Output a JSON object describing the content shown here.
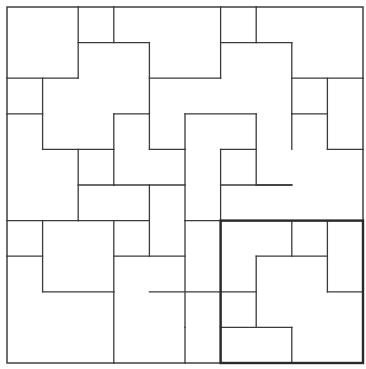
{
  "figure": {
    "type": "tiling-diagram",
    "grid": {
      "columns": 10,
      "rows": 10,
      "origin_px": [
        7,
        7
      ],
      "unit_px": 35.6
    },
    "colors": {
      "line": "#3a3a3a",
      "background": "#ffffff",
      "highlight": "#2a2a2a"
    },
    "outer_square": {
      "x0": 0,
      "y0": 0,
      "x1": 10,
      "y1": 10
    },
    "highlight_block": {
      "x0": 6,
      "y0": 6,
      "x1": 10,
      "y1": 10,
      "label": "fundamental-block"
    },
    "segments": [
      [
        2,
        0,
        2,
        2
      ],
      [
        3,
        0,
        3,
        1
      ],
      [
        2,
        1,
        4,
        1
      ],
      [
        4,
        1,
        4,
        3
      ],
      [
        0,
        2,
        2,
        2
      ],
      [
        1,
        2,
        1,
        4
      ],
      [
        0,
        3,
        1,
        3
      ],
      [
        4,
        2,
        6,
        2
      ],
      [
        6,
        0,
        6,
        2
      ],
      [
        7,
        0,
        7,
        1
      ],
      [
        6,
        1,
        8,
        1
      ],
      [
        8,
        1,
        8,
        3
      ],
      [
        8,
        2,
        10,
        2
      ],
      [
        9,
        2,
        9,
        4
      ],
      [
        8,
        3,
        9,
        3
      ],
      [
        9,
        4,
        10,
        4
      ],
      [
        3,
        3,
        4,
        3
      ],
      [
        3,
        3,
        3,
        5
      ],
      [
        1,
        4,
        3,
        4
      ],
      [
        2,
        4,
        2,
        6
      ],
      [
        4,
        3,
        4,
        4
      ],
      [
        4,
        4,
        5,
        4
      ],
      [
        5,
        3,
        5,
        4
      ],
      [
        5,
        3,
        7,
        3
      ],
      [
        7,
        3,
        7,
        5
      ],
      [
        6,
        4,
        7,
        4
      ],
      [
        6,
        4,
        6,
        6
      ],
      [
        8,
        3,
        8,
        4
      ],
      [
        7,
        5,
        8,
        5
      ],
      [
        5,
        4,
        5,
        6
      ],
      [
        3,
        5,
        5,
        5
      ],
      [
        2,
        6,
        4,
        6
      ],
      [
        0,
        6,
        2,
        6
      ],
      [
        1,
        6,
        1,
        8
      ],
      [
        0,
        7,
        1,
        7
      ],
      [
        1,
        8,
        3,
        8
      ],
      [
        3,
        8,
        3,
        10
      ],
      [
        2,
        5,
        3,
        5
      ],
      [
        4,
        5,
        4,
        7
      ],
      [
        3,
        7,
        5,
        7
      ],
      [
        3,
        6,
        3,
        8
      ],
      [
        4,
        8,
        6,
        8
      ],
      [
        5,
        6,
        6,
        6
      ],
      [
        5,
        6,
        5,
        9
      ],
      [
        6,
        5,
        8,
        5
      ],
      [
        6,
        6,
        10,
        6
      ],
      [
        8,
        6,
        8,
        7
      ],
      [
        7,
        7,
        9,
        7
      ],
      [
        7,
        7,
        7,
        9
      ],
      [
        9,
        6,
        9,
        8
      ],
      [
        9,
        8,
        10,
        8
      ],
      [
        6,
        8,
        7,
        8
      ],
      [
        6,
        9,
        8,
        9
      ],
      [
        8,
        9,
        8,
        10
      ],
      [
        5,
        9,
        5,
        10
      ],
      [
        6,
        6,
        6,
        10
      ]
    ]
  }
}
